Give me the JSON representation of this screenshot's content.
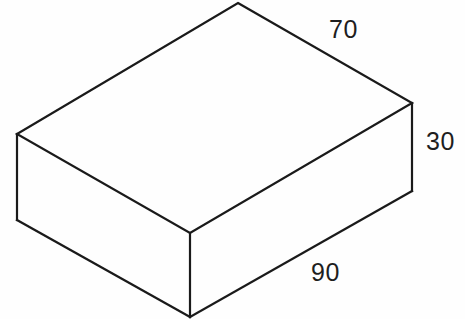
{
  "diagram": {
    "type": "isometric-rectangular-prism",
    "stroke_color": "#1a1a1a",
    "background_color": "#fefefe",
    "vertices": {
      "top_back": [
        238,
        3
      ],
      "top_left": [
        17,
        134
      ],
      "top_right": [
        412,
        103
      ],
      "top_front": [
        190,
        233
      ],
      "bottom_left": [
        17,
        220
      ],
      "bottom_right": [
        412,
        191
      ],
      "bottom_front": [
        190,
        317
      ]
    },
    "dimensions": {
      "width": "70",
      "height": "30",
      "length": "90"
    }
  }
}
